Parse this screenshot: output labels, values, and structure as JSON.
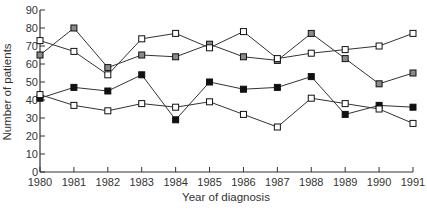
{
  "chart_data": {
    "type": "line",
    "title": "",
    "xlabel": "Year of diagnosis",
    "ylabel": "Number of patients",
    "ylim": [
      0,
      90
    ],
    "yticks": [
      0,
      10,
      20,
      30,
      40,
      50,
      60,
      70,
      80,
      90
    ],
    "grid": false,
    "legend": "none",
    "x": [
      "1980",
      "1981",
      "1982",
      "1983",
      "1984",
      "1985",
      "1986",
      "1987",
      "1988",
      "1989",
      "1990",
      "1991"
    ],
    "series": [
      {
        "name": "Series A (grey-filled squares)",
        "marker": "square-grey",
        "fill": "#8a8a8a",
        "values": [
          65,
          80,
          58,
          65,
          64,
          71,
          64,
          62,
          77,
          63,
          49,
          55
        ]
      },
      {
        "name": "Series B (open squares, upper)",
        "marker": "square-open",
        "fill": "#ffffff",
        "values": [
          73,
          67,
          54,
          74,
          77,
          69,
          78,
          63,
          66,
          68,
          70,
          77
        ]
      },
      {
        "name": "Series C (black-filled squares)",
        "marker": "square-black",
        "fill": "#111111",
        "values": [
          41,
          47,
          45,
          54,
          29,
          50,
          46,
          47,
          53,
          32,
          37,
          36
        ]
      },
      {
        "name": "Series D (open squares, lower)",
        "marker": "square-open",
        "fill": "#ffffff",
        "values": [
          43,
          37,
          34,
          38,
          36,
          39,
          32,
          25,
          41,
          38,
          35,
          27
        ]
      }
    ]
  },
  "colors": {
    "axis": "#333333",
    "line": "#333333"
  }
}
